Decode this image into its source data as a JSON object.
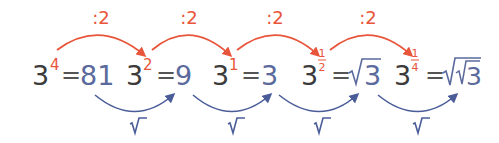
{
  "colors": {
    "orange": "#e8553a",
    "blue": "#4a5d99",
    "base_text": "#3b3b3b",
    "value_text": "#5a6a9c"
  },
  "operations": {
    "top_label": ":2",
    "bottom_label": "√‾"
  },
  "terms": [
    {
      "base": "3",
      "exponent": "4",
      "equals": "=",
      "value": "81"
    },
    {
      "base": "3",
      "exponent": "2",
      "equals": "=",
      "value": "9"
    },
    {
      "base": "3",
      "exponent": "1",
      "equals": "=",
      "value": "3"
    },
    {
      "base": "3",
      "exponent_num": "1",
      "exponent_den": "2",
      "equals": "=",
      "value_radical": "√",
      "value": "3"
    },
    {
      "base": "3",
      "exponent_num": "1",
      "exponent_den": "4",
      "equals": "=",
      "value_radical": "√√",
      "value": "3"
    }
  ],
  "top_arrows": [
    {
      "label": ":2"
    },
    {
      "label": ":2"
    },
    {
      "label": ":2"
    },
    {
      "label": ":2"
    }
  ],
  "bottom_arrows": [
    {
      "label": "√‾"
    },
    {
      "label": "√‾"
    },
    {
      "label": "√‾"
    },
    {
      "label": "√‾"
    }
  ]
}
